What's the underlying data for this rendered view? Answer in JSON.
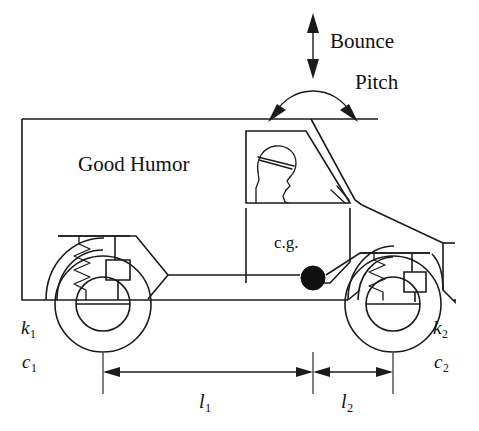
{
  "figure": {
    "width": 479,
    "height": 431,
    "background_color": "#ffffff",
    "line_color": "#1a1a1a"
  },
  "labels": {
    "bounce": "Bounce",
    "pitch": "Pitch",
    "brand": "Good Humor",
    "center_of_gravity": "c.g.",
    "rear_spring": "k",
    "rear_spring_sub": "1",
    "rear_damper": "c",
    "rear_damper_sub": "1",
    "front_spring": "k",
    "front_spring_sub": "2",
    "front_damper": "c",
    "front_damper_sub": "2",
    "length_rear": "l",
    "length_rear_sub": "1",
    "length_front": "l",
    "length_front_sub": "2"
  },
  "annotations": {
    "bounce_arrow": "vertical-double-headed-arrow",
    "pitch_arrow": "semicircular-double-headed-arc-arrow",
    "cg_marker": "filled-black-circle",
    "rear_suspension": "spring-and-damper",
    "front_suspension": "spring-and-damper",
    "dimension_l1": "horizontal-double-headed-arrow",
    "dimension_l2": "horizontal-double-headed-arrow"
  },
  "geometry": {
    "rear_wheel_center_x": 103,
    "front_wheel_center_x": 393,
    "cg_x": 313,
    "dimension_line_y": 372,
    "roof_y": 119
  }
}
